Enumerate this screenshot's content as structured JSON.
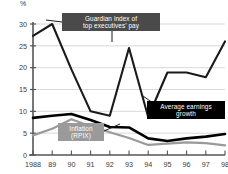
{
  "chart_data": {
    "type": "line",
    "title": "",
    "subtitle": "",
    "xlabel": "",
    "ylabel": "%",
    "unit_label": "%",
    "grid": true,
    "legend_position": "inline-annotations",
    "xlim": [
      1988,
      1998
    ],
    "ylim": [
      0,
      30
    ],
    "yticks": [
      0,
      5,
      10,
      15,
      20,
      25,
      30
    ],
    "ytick_labels": [
      "0",
      "5",
      "10",
      "15",
      "20",
      "25",
      "30"
    ],
    "x": [
      1988,
      1989,
      1990,
      1991,
      1992,
      1993,
      1994,
      1995,
      1996,
      1997,
      1998
    ],
    "xtick_labels": [
      "1988",
      "89",
      "90",
      "91",
      "92",
      "93",
      "94",
      "95",
      "96",
      "97",
      "98"
    ],
    "series": [
      {
        "name": "Guardian index of top executives' pay",
        "color": "#1a1a1a",
        "width": 2.1,
        "values": [
          27.3,
          30.0,
          19.6,
          10.0,
          9.0,
          24.5,
          8.7,
          18.9,
          18.9,
          17.8,
          26.0
        ]
      },
      {
        "name": "Average earnings growth",
        "color": "#000000",
        "width": 2.6,
        "values": [
          8.5,
          9.0,
          9.4,
          8.0,
          6.4,
          6.3,
          3.8,
          3.2,
          3.8,
          4.2,
          4.8
        ]
      },
      {
        "name": "Inflation (RPIX)",
        "color": "#9a9a9a",
        "width": 2.2,
        "values": [
          4.5,
          6.0,
          8.2,
          6.6,
          5.2,
          3.9,
          2.3,
          2.6,
          2.9,
          2.7,
          2.2
        ]
      }
    ]
  },
  "annotations": {
    "guardian": {
      "line1": "Guardian index of",
      "line2": "top executives' pay",
      "box_color": "#4a4a4a"
    },
    "earnings": {
      "line1": "Average earnings",
      "line2": "growth",
      "box_color": "#000000"
    },
    "inflation": {
      "line1": "Inflation",
      "line2": "(RPIX)",
      "box_color": "#9a9a9a"
    }
  },
  "axis": {
    "unit": "%",
    "axis_color": "#555555",
    "grid_color": "#cfcfcf"
  }
}
